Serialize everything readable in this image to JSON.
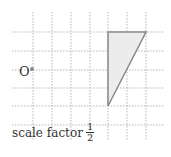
{
  "diagram": {
    "grid": {
      "x_lines": [
        33,
        52,
        71,
        90,
        108,
        127,
        146
      ],
      "y_lines": [
        32,
        51,
        70,
        88,
        106,
        125
      ],
      "x_range": [
        12,
        165
      ],
      "y_range": [
        12,
        140
      ],
      "color": "#b5b5b5"
    },
    "center_point": {
      "label": "O",
      "x": 32,
      "y": 69,
      "color": "#888888"
    },
    "shape": {
      "type": "triangle",
      "points": [
        [
          108,
          32
        ],
        [
          146,
          32
        ],
        [
          108,
          106
        ]
      ],
      "fill": "#ececec",
      "stroke": "#888888"
    },
    "caption": {
      "text": "scale factor",
      "fraction_numerator": "1",
      "fraction_denominator": "2"
    }
  }
}
